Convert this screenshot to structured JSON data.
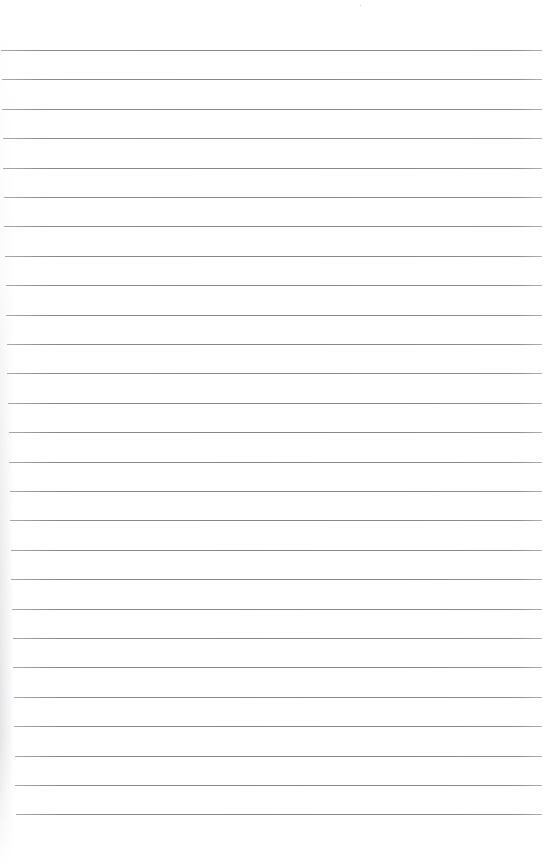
{
  "document": {
    "type": "lined-paper",
    "background_color": "#ffffff",
    "line_color": "#888888",
    "line_count": 27,
    "first_line_y": 50,
    "line_spacing": 29.4,
    "line_right_x": 542,
    "line_left_x_top": 1,
    "line_left_x_bottom": 16
  }
}
